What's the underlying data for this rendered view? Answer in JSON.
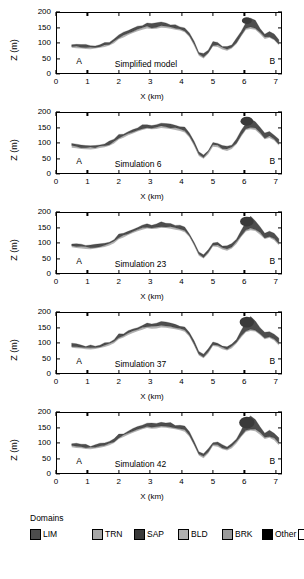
{
  "figure": {
    "type": "geological-cross-section-series",
    "panel_count": 5
  },
  "axes": {
    "ylabel": "Z (m)",
    "xlabel": "X (km)",
    "yticks": [
      0,
      50,
      100,
      150,
      200
    ],
    "xticks": [
      0,
      1,
      2,
      3,
      4,
      5,
      6,
      7
    ],
    "ylim": [
      0,
      200
    ],
    "xlim": [
      0,
      7.2
    ],
    "endpoint_left": "A",
    "endpoint_right": "B"
  },
  "panels": [
    {
      "caption": "Simplified model"
    },
    {
      "caption": "Simulation 6"
    },
    {
      "caption": "Simulation 23"
    },
    {
      "caption": "Simulation 37"
    },
    {
      "caption": "Simulation 42"
    }
  ],
  "legend": {
    "title": "Domains",
    "items": [
      {
        "label": "LIM",
        "color": "#4d4d4d"
      },
      {
        "label": "TRN",
        "color": "#a6a6a6"
      },
      {
        "label": "SAP",
        "color": "#3a3a3a"
      },
      {
        "label": "BLD",
        "color": "#b0b0b0"
      },
      {
        "label": "BRK",
        "color": "#9a9a9a"
      },
      {
        "label": "Other",
        "color": "#000000"
      },
      {
        "label": "N/A",
        "color": "#ffffff"
      }
    ]
  },
  "chart_data": {
    "type": "area",
    "title": "",
    "xlabel": "X (km)",
    "ylabel": "Z (m)",
    "xlim": [
      0,
      7.2
    ],
    "ylim": [
      0,
      200
    ],
    "xticks": [
      0,
      1,
      2,
      3,
      4,
      5,
      6,
      7
    ],
    "yticks": [
      0,
      50,
      100,
      150,
      200
    ],
    "grid": false,
    "legend_position": "below",
    "x": [
      0.5,
      0.65,
      0.8,
      0.95,
      1.1,
      1.25,
      1.4,
      1.55,
      1.7,
      1.85,
      2.0,
      2.15,
      2.3,
      2.45,
      2.6,
      2.75,
      2.9,
      3.05,
      3.2,
      3.35,
      3.5,
      3.65,
      3.8,
      3.95,
      4.1,
      4.25,
      4.4,
      4.55,
      4.7,
      4.85,
      5.0,
      5.15,
      5.3,
      5.45,
      5.6,
      5.75,
      5.9,
      6.05,
      6.2,
      6.35,
      6.5,
      6.65,
      6.8,
      6.95,
      7.1
    ],
    "series": [
      {
        "name": "Simplified model",
        "surface": [
          96,
          95,
          93,
          92,
          91,
          93,
          96,
          98,
          104,
          112,
          126,
          132,
          140,
          146,
          152,
          158,
          163,
          160,
          162,
          165,
          164,
          161,
          158,
          155,
          150,
          132,
          104,
          72,
          63,
          78,
          102,
          100,
          92,
          88,
          95,
          112,
          138,
          162,
          180,
          170,
          148,
          130,
          136,
          128,
          112,
          98
        ],
        "base": [
          90,
          88,
          87,
          86,
          85,
          87,
          90,
          92,
          97,
          104,
          117,
          123,
          131,
          137,
          143,
          148,
          152,
          150,
          151,
          154,
          153,
          151,
          148,
          145,
          140,
          124,
          96,
          64,
          55,
          70,
          94,
          92,
          84,
          80,
          87,
          102,
          126,
          148,
          150,
          148,
          134,
          118,
          122,
          114,
          98,
          86
        ]
      },
      {
        "name": "Simulation 6",
        "surface": [
          96,
          95,
          93,
          91,
          90,
          92,
          95,
          97,
          103,
          111,
          124,
          130,
          139,
          145,
          151,
          157,
          162,
          159,
          161,
          164,
          163,
          160,
          157,
          154,
          149,
          131,
          103,
          71,
          62,
          77,
          101,
          99,
          91,
          87,
          94,
          111,
          137,
          161,
          178,
          169,
          147,
          129,
          135,
          127,
          111,
          97
        ],
        "base": [
          90,
          88,
          86,
          85,
          84,
          86,
          89,
          91,
          96,
          103,
          116,
          122,
          130,
          136,
          142,
          147,
          151,
          149,
          150,
          153,
          152,
          150,
          147,
          144,
          139,
          123,
          95,
          63,
          54,
          69,
          93,
          91,
          83,
          79,
          86,
          101,
          125,
          147,
          149,
          147,
          133,
          117,
          121,
          113,
          97,
          85
        ]
      },
      {
        "name": "Simulation 23",
        "surface": [
          97,
          96,
          94,
          92,
          91,
          93,
          96,
          98,
          104,
          112,
          125,
          131,
          140,
          146,
          152,
          158,
          163,
          160,
          162,
          165,
          164,
          161,
          158,
          155,
          150,
          132,
          104,
          72,
          63,
          78,
          102,
          100,
          92,
          88,
          95,
          112,
          140,
          168,
          184,
          172,
          149,
          131,
          137,
          129,
          113,
          99
        ],
        "base": [
          91,
          89,
          87,
          86,
          85,
          87,
          90,
          92,
          97,
          104,
          117,
          123,
          131,
          137,
          143,
          148,
          152,
          150,
          151,
          154,
          153,
          151,
          148,
          145,
          140,
          124,
          96,
          64,
          55,
          70,
          94,
          92,
          84,
          80,
          87,
          102,
          124,
          142,
          146,
          144,
          132,
          118,
          122,
          114,
          98,
          86
        ]
      },
      {
        "name": "Simulation 37",
        "surface": [
          96,
          95,
          93,
          91,
          90,
          92,
          95,
          98,
          104,
          112,
          126,
          132,
          140,
          146,
          152,
          158,
          164,
          161,
          163,
          166,
          165,
          162,
          159,
          156,
          151,
          133,
          105,
          73,
          64,
          79,
          103,
          101,
          93,
          89,
          96,
          113,
          141,
          170,
          186,
          174,
          150,
          132,
          138,
          130,
          114,
          100
        ],
        "base": [
          90,
          88,
          87,
          85,
          84,
          86,
          89,
          92,
          97,
          104,
          117,
          123,
          131,
          137,
          143,
          148,
          153,
          151,
          152,
          155,
          154,
          152,
          149,
          146,
          141,
          125,
          97,
          65,
          56,
          71,
          95,
          93,
          85,
          81,
          88,
          103,
          123,
          140,
          144,
          142,
          131,
          117,
          121,
          113,
          97,
          85
        ]
      },
      {
        "name": "Simulation 42",
        "surface": [
          97,
          96,
          94,
          92,
          91,
          93,
          96,
          99,
          105,
          113,
          126,
          132,
          141,
          147,
          153,
          159,
          164,
          161,
          163,
          166,
          165,
          162,
          159,
          156,
          151,
          133,
          105,
          73,
          64,
          79,
          103,
          101,
          93,
          89,
          96,
          113,
          142,
          171,
          187,
          175,
          151,
          133,
          139,
          131,
          115,
          101
        ],
        "base": [
          91,
          89,
          88,
          86,
          85,
          87,
          90,
          93,
          98,
          105,
          118,
          124,
          132,
          138,
          144,
          149,
          153,
          151,
          152,
          155,
          154,
          152,
          149,
          146,
          141,
          125,
          97,
          65,
          56,
          71,
          95,
          93,
          85,
          81,
          88,
          103,
          124,
          141,
          145,
          143,
          132,
          118,
          122,
          114,
          98,
          86
        ]
      }
    ]
  }
}
